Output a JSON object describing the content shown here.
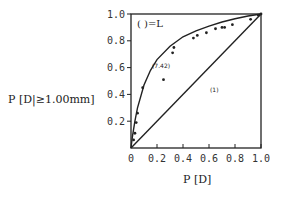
{
  "chart_data": {
    "type": "scatter",
    "title": "",
    "xlabel": "P [D]",
    "ylabel": "P [D|≥1.00mm]",
    "xlim": [
      0,
      1.0
    ],
    "ylim": [
      0,
      1.0
    ],
    "xticks": [
      "0",
      "0.2",
      "0.4",
      "0.6",
      "0.8",
      "1.0"
    ],
    "yticks": [
      "0.2",
      "0.4",
      "0.6",
      "0.8",
      "1.0"
    ],
    "grid": false,
    "legend_note": "( )=L",
    "annotations": [
      {
        "text": "(7.42)",
        "x": 0.17,
        "y": 0.61
      },
      {
        "text": "(1)",
        "x": 0.6,
        "y": 0.42
      }
    ],
    "series": [
      {
        "name": "observed",
        "kind": "points",
        "x": [
          0.02,
          0.03,
          0.04,
          0.05,
          0.09,
          0.25,
          0.32,
          0.33,
          0.48,
          0.51,
          0.58,
          0.65,
          0.7,
          0.72,
          0.78,
          0.92,
          0.98,
          1.0
        ],
        "y": [
          0.06,
          0.11,
          0.19,
          0.26,
          0.45,
          0.51,
          0.71,
          0.75,
          0.82,
          0.84,
          0.86,
          0.89,
          0.9,
          0.9,
          0.92,
          0.96,
          0.99,
          1.0
        ]
      },
      {
        "name": "L=7.42 curve",
        "kind": "line",
        "x": [
          0,
          0.01,
          0.03,
          0.05,
          0.1,
          0.15,
          0.2,
          0.3,
          0.4,
          0.5,
          0.6,
          0.7,
          0.8,
          0.9,
          1.0
        ],
        "y": [
          0,
          0.08,
          0.2,
          0.3,
          0.47,
          0.58,
          0.66,
          0.76,
          0.83,
          0.875,
          0.91,
          0.94,
          0.965,
          0.985,
          1.0
        ]
      },
      {
        "name": "L=1 line",
        "kind": "line",
        "x": [
          0,
          1.0
        ],
        "y": [
          0,
          1.0
        ]
      }
    ]
  },
  "labels": {
    "y_axis": "P [D|≥1.00mm]",
    "x_axis": "P [D]",
    "legend": "( )=L",
    "curve_label": "(7.42)",
    "line_label": "(1)"
  }
}
